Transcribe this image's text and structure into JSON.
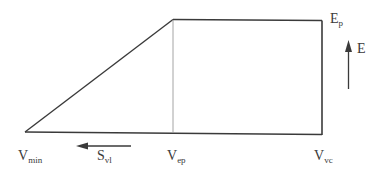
{
  "diagram": {
    "type": "trapezoid-energy-profile",
    "line_color": "#3a3a3a",
    "guide_color": "#9a9a9a",
    "labels": {
      "vmin": {
        "main": "V",
        "sub": "min"
      },
      "svl": {
        "main": "S",
        "sub": "vl"
      },
      "vep": {
        "main": "V",
        "sub": "ep"
      },
      "vvc": {
        "main": "V",
        "sub": "vc"
      },
      "ep": {
        "main": "E",
        "sub": "p"
      },
      "e": {
        "main": "E"
      }
    },
    "arrows": {
      "svl_direction": "left",
      "e_direction": "up"
    }
  }
}
